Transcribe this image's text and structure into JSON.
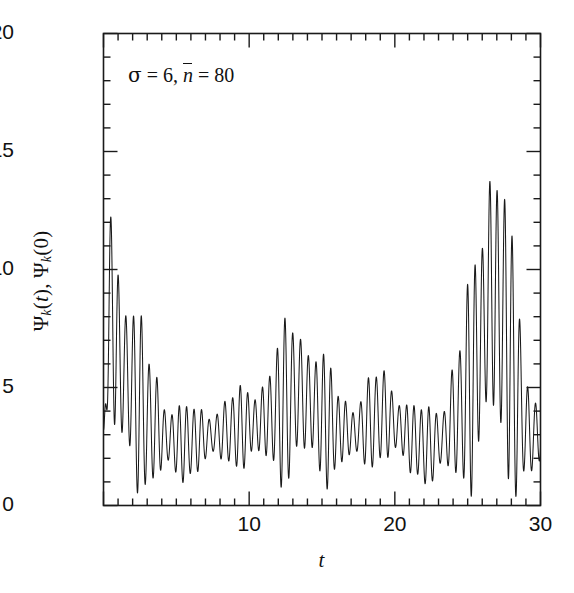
{
  "figure": {
    "annotation": {
      "sigma_symbol": "σ",
      "sigma_text": " = 6,",
      "nbar_symbol": "n",
      "nbar_text": " = 80"
    },
    "axes": {
      "x_title": "t",
      "y_title_parts": {
        "psi1": "Ψ",
        "sub1": "k",
        "mid": "(",
        "var": "t",
        "close1": "), ",
        "psi2": "Ψ",
        "sub2": "k",
        "close2": "(0)"
      },
      "x_tick_labels": [
        "10",
        "20",
        "30"
      ],
      "x_tick_values": [
        10,
        20,
        30
      ],
      "y_tick_labels": [
        "0",
        "5",
        "10",
        "15",
        "20"
      ],
      "y_tick_values": [
        0,
        5,
        10,
        15,
        20
      ],
      "line_color": "#1a1a1a",
      "frame_color": "#1a1a1a"
    }
  },
  "chart_data": {
    "type": "line",
    "title": "",
    "subtitle": "",
    "xlabel": "t",
    "ylabel": "Ψ_k(t), Ψ_k(0)",
    "annotation": "σ = 6, n̄ = 80",
    "parameters": {
      "sigma": 6,
      "n_bar": 80
    },
    "xlim": [
      0,
      30
    ],
    "ylim": [
      0,
      20
    ],
    "x_major_ticks": [
      10,
      20,
      30
    ],
    "x_minor_tick_step": 1,
    "y_major_ticks": [
      0,
      5,
      10,
      15,
      20
    ],
    "y_minor_tick_step": 1,
    "grid": false,
    "legend": null,
    "legend_position": "none",
    "series": [
      {
        "name": "Ψ_k(t), Ψ_k(0)",
        "color": "#1a1a1a",
        "description": "Collapse-and-revival oscillation: large initial transient near t=0 decaying into a dense collapse band around mean 3, a fractional revival near t=13.3 reaching 9.3, and a full revival peaking at 18.4 near t=26.6, then decaying to a rising edge at t=30.",
        "envelope_upper": [
          {
            "t": 0.0,
            "y": 3.2
          },
          {
            "t": 0.45,
            "y": 15.0
          },
          {
            "t": 1.45,
            "y": 11.1
          },
          {
            "t": 2.45,
            "y": 8.4
          },
          {
            "t": 3.4,
            "y": 6.6
          },
          {
            "t": 4.4,
            "y": 5.2
          },
          {
            "t": 5.4,
            "y": 4.6
          },
          {
            "t": 6.4,
            "y": 4.4
          },
          {
            "t": 7.4,
            "y": 4.6
          },
          {
            "t": 8.4,
            "y": 4.9
          },
          {
            "t": 9.4,
            "y": 5.2
          },
          {
            "t": 10.4,
            "y": 5.8
          },
          {
            "t": 11.4,
            "y": 6.6
          },
          {
            "t": 12.4,
            "y": 8.0
          },
          {
            "t": 13.3,
            "y": 9.3
          },
          {
            "t": 14.2,
            "y": 8.2
          },
          {
            "t": 15.2,
            "y": 6.6
          },
          {
            "t": 16.2,
            "y": 5.4
          },
          {
            "t": 17.2,
            "y": 5.0
          },
          {
            "t": 18.2,
            "y": 5.6
          },
          {
            "t": 19.2,
            "y": 6.3
          },
          {
            "t": 20.2,
            "y": 5.6
          },
          {
            "t": 21.2,
            "y": 4.6
          },
          {
            "t": 22.2,
            "y": 4.4
          },
          {
            "t": 23.2,
            "y": 5.2
          },
          {
            "t": 24.2,
            "y": 7.3
          },
          {
            "t": 25.3,
            "y": 10.3
          },
          {
            "t": 26.0,
            "y": 14.6
          },
          {
            "t": 26.6,
            "y": 18.4
          },
          {
            "t": 27.5,
            "y": 15.6
          },
          {
            "t": 28.3,
            "y": 10.2
          },
          {
            "t": 29.0,
            "y": 6.5
          },
          {
            "t": 29.6,
            "y": 5.6
          },
          {
            "t": 30.0,
            "y": 6.1
          }
        ],
        "envelope_lower": [
          {
            "t": 0.0,
            "y": 3.2
          },
          {
            "t": 1.0,
            "y": 0.1
          },
          {
            "t": 3.0,
            "y": 0.2
          },
          {
            "t": 5.0,
            "y": 0.6
          },
          {
            "t": 7.0,
            "y": 1.3
          },
          {
            "t": 9.0,
            "y": 1.4
          },
          {
            "t": 11.0,
            "y": 1.0
          },
          {
            "t": 13.0,
            "y": 0.4
          },
          {
            "t": 15.0,
            "y": 0.6
          },
          {
            "t": 17.0,
            "y": 1.2
          },
          {
            "t": 19.0,
            "y": 1.4
          },
          {
            "t": 21.0,
            "y": 1.0
          },
          {
            "t": 23.0,
            "y": 0.4
          },
          {
            "t": 25.0,
            "y": 0.2
          },
          {
            "t": 27.0,
            "y": 0.1
          },
          {
            "t": 29.0,
            "y": 0.1
          },
          {
            "t": 30.0,
            "y": 0.4
          }
        ],
        "notable_peaks": [
          {
            "t": 0.45,
            "y": 15.0,
            "label": "initial transient"
          },
          {
            "t": 1.45,
            "y": 11.1,
            "label": ""
          },
          {
            "t": 2.45,
            "y": 8.4,
            "label": ""
          },
          {
            "t": 13.3,
            "y": 9.3,
            "label": "fractional revival"
          },
          {
            "t": 26.6,
            "y": 18.4,
            "label": "full revival maximum"
          },
          {
            "t": 27.5,
            "y": 15.6,
            "label": ""
          }
        ],
        "carrier_period": 0.52,
        "mean_level": 3.1
      }
    ]
  }
}
